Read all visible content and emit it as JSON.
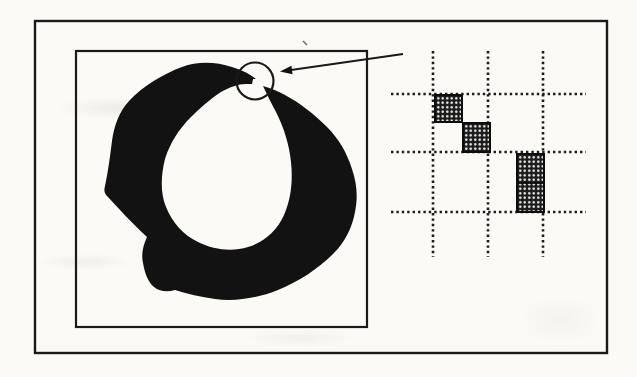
{
  "canvas": {
    "width": 637,
    "height": 377,
    "view_box": "0 0 637 377",
    "paper": "#fbfaf7"
  },
  "ink": {
    "line": "#1a1a1a",
    "fill": "#121212"
  },
  "outer_frame": {
    "x": 35,
    "y": 21,
    "width": 572,
    "height": 332,
    "stroke_width": 2.4
  },
  "shape_box": {
    "x": 76,
    "y": 51,
    "width": 291,
    "height": 276,
    "stroke_width": 2.2
  },
  "blob": {
    "path": "M 256 79 C 250 74 242 70 232 67 C 216 62 198 61 182 67 C 163 74 143 86 129 101 C 119 112 114 126 112 141 C 110 157 108 172 105 186 C 104 190 104 193 107 196 C 117 207 132 223 147 237 C 143 246 141 254 143 263 C 145 274 148 282 154 287 C 160 292 168 292 175 290 C 187 294 201 297 215 299 C 235 302 258 298 278 290 C 298 282 318 269 333 254 C 345 242 352 228 355 212 C 358 197 357 184 352 169 C 347 153 339 139 327 127 C 314 114 300 103 285 95 C 278 91 270 88 263 86 C 267 94 271 103 276 112 C 284 128 289 144 291 162 C 293 181 291 199 284 215 C 277 231 264 242 248 247 C 232 252 214 250 198 242 C 183 235 172 222 166 207 C 160 192 161 175 165 159 C 170 143 179 129 191 117 C 199 109 210 99 221 92 C 230 87 238 84 246 84 L 252 84 L 253 79 Z"
  },
  "magnifier": {
    "cx": 255,
    "cy": 81,
    "r": 18.5,
    "stroke_width": 2.2,
    "fill": "none"
  },
  "arrow": {
    "x1": 403,
    "y1": 54,
    "x2": 284,
    "y2": 71,
    "stroke_width": 2,
    "head_points": "280,71.5 291.5,65.8 292.5,74.2"
  },
  "speck": {
    "x1": 303,
    "y1": 41,
    "x2": 307,
    "y2": 45,
    "stroke_width": 1.4
  },
  "pixel_grid": {
    "dot_color": "#1c1c1c",
    "line_width": 2.6,
    "dash": "2.4 3",
    "v_lines": {
      "xs": [
        433,
        488,
        543
      ],
      "y1": 51,
      "y2": 257
    },
    "h_lines": {
      "ys": [
        94,
        152,
        212
      ],
      "x1": 391,
      "x2": 586
    },
    "pixels": [
      {
        "x": 434,
        "y": 94,
        "width": 29,
        "height": 29,
        "divider": false
      },
      {
        "x": 462,
        "y": 122,
        "width": 29,
        "height": 31,
        "divider": false
      },
      {
        "x": 516,
        "y": 153,
        "width": 29,
        "height": 60,
        "divider": true
      }
    ]
  }
}
